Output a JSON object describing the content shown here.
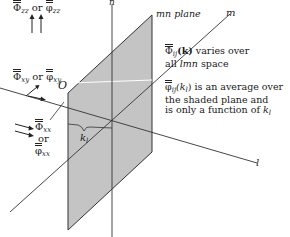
{
  "diagram": {
    "axes": {
      "n": "n",
      "m": "m",
      "l": "l",
      "origin": "O"
    },
    "plane_label": "mn plane",
    "kl_label": "k",
    "kl_sub": "l",
    "labels": {
      "top_left": {
        "sym1": "Φ",
        "sub1": "zz",
        "or": "or",
        "sym2": "φ",
        "sub2": "zz"
      },
      "mid_left": {
        "sym1": "Φ",
        "sub1": "xy",
        "or": "or",
        "sym2": "φ",
        "sub2": "xy"
      },
      "bottom_left": {
        "sym1": "Φ",
        "sub1": "xx",
        "or": "or",
        "sym2": "φ",
        "sub2": "xx"
      }
    },
    "notes": {
      "varies_line1_sym": "Φ",
      "varies_line1_sub": "ij",
      "varies_line1_arg": "(k)",
      "varies_line1_rest": " varies over",
      "varies_line2_pre": "all ",
      "varies_line2_it": "lmn",
      "varies_line2_post": " space",
      "avg_line1_sym": "φ",
      "avg_line1_sub": "ij",
      "avg_line1_arg": "(k",
      "avg_line1_argsub": "l",
      "avg_line1_argclose": ")",
      "avg_line1_rest": " is an average over",
      "avg_line2": "the shaded plane and",
      "avg_line3_pre": "is only a function of ",
      "avg_line3_k": "k",
      "avg_line3_ksub": "l"
    },
    "colors": {
      "plane_fill": "#c4c4c4",
      "line": "#333333"
    }
  }
}
